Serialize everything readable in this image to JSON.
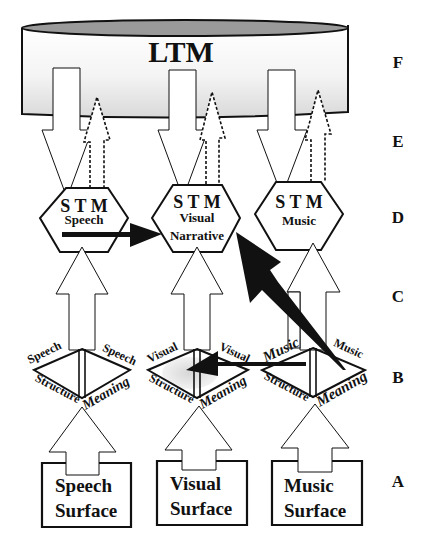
{
  "ltm": {
    "label": "LTM"
  },
  "levels": [
    "F",
    "E",
    "D",
    "C",
    "B",
    "A"
  ],
  "stm": [
    {
      "title": "S T M",
      "line1": "Speech",
      "line2": ""
    },
    {
      "title": "S T M",
      "line1": "Visual",
      "line2": "Narrative"
    },
    {
      "title": "S T M",
      "line1": "Music",
      "line2": ""
    }
  ],
  "diamonds": [
    {
      "top_left": "Speech",
      "top_right": "Speech",
      "bottom_left": "Structure",
      "bottom_right": "Meaning"
    },
    {
      "top_left": "Visual",
      "top_right": "Visual",
      "bottom_left": "Structure",
      "bottom_right": "Meaning"
    },
    {
      "top_left": "Music",
      "top_right": "Music",
      "bottom_left": "Structure",
      "bottom_right": "Meaning"
    }
  ],
  "surfaces": [
    {
      "line1": "Speech",
      "line2": "Surface"
    },
    {
      "line1": "Visual",
      "line2": "Surface"
    },
    {
      "line1": "Music",
      "line2": "Surface"
    }
  ],
  "colors": {
    "stroke": "#111111",
    "ltm_top": "#9a9a9a",
    "shade": "#d8d8d8"
  }
}
